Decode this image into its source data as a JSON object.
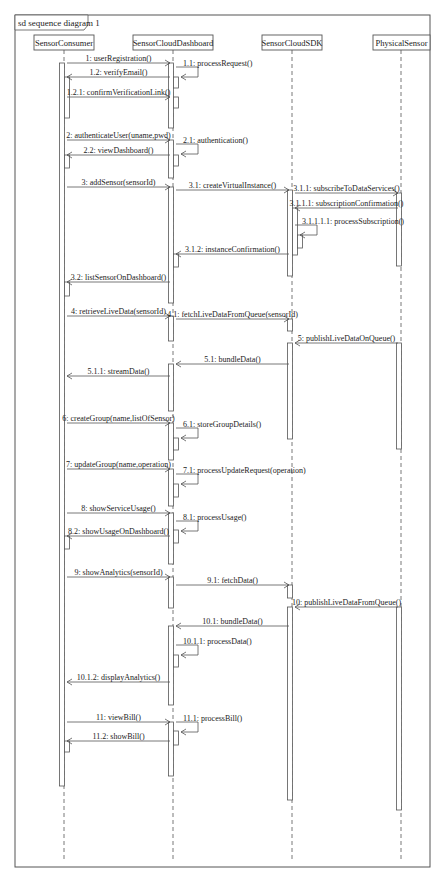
{
  "frame": {
    "title": "sd sequence diagram 1"
  },
  "lifelines": [
    {
      "name": "SensorConsumer",
      "x": 64,
      "box_x": 34,
      "box_w": 60
    },
    {
      "name": "SensorCloudDashboard",
      "x": 173,
      "box_x": 133,
      "box_w": 80
    },
    {
      "name": "SensorCloudSDK",
      "x": 292,
      "box_x": 262,
      "box_w": 60
    },
    {
      "name": "PhysicalSensor",
      "x": 401,
      "box_x": 373,
      "box_w": 57
    }
  ],
  "messages": [
    {
      "id": "m1",
      "label": "1: userRegistration()",
      "from": 0,
      "to": 1,
      "y": 63,
      "type": "call"
    },
    {
      "id": "m1_1",
      "label": "1.1: processRequest()",
      "from": 1,
      "to": 1,
      "y": 67,
      "type": "self"
    },
    {
      "id": "m1_2",
      "label": "1.2: verifyEmail()",
      "from": 1,
      "to": 0,
      "y": 77,
      "type": "return"
    },
    {
      "id": "m1_2_1",
      "label": "1.2.1: confirmVerificationLink()",
      "from": 0,
      "to": 1,
      "y": 97,
      "type": "call"
    },
    {
      "id": "m2",
      "label": "2: authenticateUser(uname,pwd)",
      "from": 0,
      "to": 1,
      "y": 140,
      "type": "call"
    },
    {
      "id": "m2_1",
      "label": "2.1: authentication()",
      "from": 1,
      "to": 1,
      "y": 144,
      "type": "self"
    },
    {
      "id": "m2_2",
      "label": "2.2: viewDashboard()",
      "from": 1,
      "to": 0,
      "y": 155,
      "type": "return"
    },
    {
      "id": "m3",
      "label": "3: addSensor(sensorId)",
      "from": 0,
      "to": 1,
      "y": 187,
      "type": "call"
    },
    {
      "id": "m3_1",
      "label": "3.1: createVirtualInstance()",
      "from": 1,
      "to": 2,
      "y": 190,
      "type": "call"
    },
    {
      "id": "m3_1_1",
      "label": "3.1.1: subscribeToDataServices()",
      "from": 2,
      "to": 3,
      "y": 193,
      "type": "call"
    },
    {
      "id": "m3_1_1_1",
      "label": "3.1.1.1: subscriptionConfirmation()",
      "from": 3,
      "to": 2,
      "y": 208,
      "type": "return"
    },
    {
      "id": "m3_1_1_1_1",
      "label": "3.1.1.1.1: processSubscription()",
      "from": 2,
      "to": 2,
      "y": 225,
      "type": "self"
    },
    {
      "id": "m3_1_2",
      "label": "3.1.2: instanceConfirmation()",
      "from": 2,
      "to": 1,
      "y": 254,
      "type": "return"
    },
    {
      "id": "m3_2",
      "label": "3.2: listSensorOnDashboard()",
      "from": 1,
      "to": 0,
      "y": 282,
      "type": "return"
    },
    {
      "id": "m4",
      "label": "4: retrieveLiveData(sensorId)",
      "from": 0,
      "to": 1,
      "y": 316,
      "type": "call"
    },
    {
      "id": "m4_1",
      "label": "4.1: fetchLiveDataFromQueue(sensorId)",
      "from": 1,
      "to": 2,
      "y": 319,
      "type": "call"
    },
    {
      "id": "m5",
      "label": "5: publishLiveDataOnQueue()",
      "from": 3,
      "to": 2,
      "y": 343,
      "type": "return"
    },
    {
      "id": "m5_1",
      "label": "5.1: bundleData()",
      "from": 2,
      "to": 1,
      "y": 364,
      "type": "return"
    },
    {
      "id": "m5_1_1",
      "label": "5.1.1: streamData()",
      "from": 1,
      "to": 0,
      "y": 376,
      "type": "return"
    },
    {
      "id": "m6",
      "label": "6: createGroup(name,listOfSensor)",
      "from": 0,
      "to": 1,
      "y": 423,
      "type": "call"
    },
    {
      "id": "m6_1",
      "label": "6.1: storeGroupDetails()",
      "from": 1,
      "to": 1,
      "y": 428,
      "type": "self"
    },
    {
      "id": "m7",
      "label": "7: updateGroup(name,operation)",
      "from": 0,
      "to": 1,
      "y": 469,
      "type": "call"
    },
    {
      "id": "m7_1",
      "label": "7.1: processUpdateRequest(operation)",
      "from": 1,
      "to": 1,
      "y": 474,
      "type": "self"
    },
    {
      "id": "m8",
      "label": "8: showServiceUsage()",
      "from": 0,
      "to": 1,
      "y": 513,
      "type": "call"
    },
    {
      "id": "m8_1",
      "label": "8.1: processUsage()",
      "from": 1,
      "to": 1,
      "y": 521,
      "type": "self"
    },
    {
      "id": "m8_2",
      "label": "8.2: showUsageOnDashboard()",
      "from": 1,
      "to": 0,
      "y": 536,
      "type": "return"
    },
    {
      "id": "m9",
      "label": "9: showAnalytics(sensorId)",
      "from": 0,
      "to": 1,
      "y": 577,
      "type": "call"
    },
    {
      "id": "m9_1",
      "label": "9.1: fetchData()",
      "from": 1,
      "to": 2,
      "y": 585,
      "type": "call"
    },
    {
      "id": "m10",
      "label": "10: publishLiveDataFromQueue()",
      "from": 3,
      "to": 2,
      "y": 607,
      "type": "return"
    },
    {
      "id": "m10_1",
      "label": "10.1: bundleData()",
      "from": 2,
      "to": 1,
      "y": 626,
      "type": "return"
    },
    {
      "id": "m10_1_1",
      "label": "10.1.1: processData()",
      "from": 1,
      "to": 1,
      "y": 645,
      "type": "self"
    },
    {
      "id": "m10_1_2",
      "label": "10.1.2: displayAnalytics()",
      "from": 1,
      "to": 0,
      "y": 682,
      "type": "return"
    },
    {
      "id": "m11",
      "label": "11: viewBill()",
      "from": 0,
      "to": 1,
      "y": 722,
      "type": "call"
    },
    {
      "id": "m11_1",
      "label": "11.1: processBill()",
      "from": 1,
      "to": 1,
      "y": 722,
      "type": "self"
    },
    {
      "id": "m11_2",
      "label": "11.2: showBill()",
      "from": 1,
      "to": 0,
      "y": 741,
      "type": "return"
    }
  ],
  "activations": [
    {
      "lifeline": 0,
      "y1": 63,
      "y2": 786,
      "dx": -2
    },
    {
      "lifeline": 0,
      "y1": 77,
      "y2": 118,
      "dx": 3
    },
    {
      "lifeline": 0,
      "y1": 155,
      "y2": 168,
      "dx": 3
    },
    {
      "lifeline": 0,
      "y1": 282,
      "y2": 296,
      "dx": 3
    },
    {
      "lifeline": 0,
      "y1": 536,
      "y2": 549,
      "dx": 3
    },
    {
      "lifeline": 0,
      "y1": 741,
      "y2": 752,
      "dx": 3
    },
    {
      "lifeline": 1,
      "y1": 63,
      "y2": 128,
      "dx": -2
    },
    {
      "lifeline": 1,
      "y1": 77,
      "y2": 88,
      "dx": 3
    },
    {
      "lifeline": 1,
      "y1": 97,
      "y2": 108,
      "dx": 3
    },
    {
      "lifeline": 1,
      "y1": 140,
      "y2": 178,
      "dx": -2
    },
    {
      "lifeline": 1,
      "y1": 155,
      "y2": 166,
      "dx": 3
    },
    {
      "lifeline": 1,
      "y1": 187,
      "y2": 303,
      "dx": -2
    },
    {
      "lifeline": 1,
      "y1": 254,
      "y2": 267,
      "dx": 3
    },
    {
      "lifeline": 1,
      "y1": 316,
      "y2": 341,
      "dx": -2
    },
    {
      "lifeline": 1,
      "y1": 364,
      "y2": 411,
      "dx": -2
    },
    {
      "lifeline": 1,
      "y1": 423,
      "y2": 460,
      "dx": -2
    },
    {
      "lifeline": 1,
      "y1": 438,
      "y2": 450,
      "dx": 3
    },
    {
      "lifeline": 1,
      "y1": 469,
      "y2": 506,
      "dx": -2
    },
    {
      "lifeline": 1,
      "y1": 484,
      "y2": 497,
      "dx": 3
    },
    {
      "lifeline": 1,
      "y1": 513,
      "y2": 564,
      "dx": -2
    },
    {
      "lifeline": 1,
      "y1": 530,
      "y2": 543,
      "dx": 3
    },
    {
      "lifeline": 1,
      "y1": 577,
      "y2": 608,
      "dx": -2
    },
    {
      "lifeline": 1,
      "y1": 626,
      "y2": 705,
      "dx": -2
    },
    {
      "lifeline": 1,
      "y1": 655,
      "y2": 667,
      "dx": 3
    },
    {
      "lifeline": 1,
      "y1": 722,
      "y2": 776,
      "dx": -2
    },
    {
      "lifeline": 1,
      "y1": 731,
      "y2": 745,
      "dx": 3
    },
    {
      "lifeline": 2,
      "y1": 190,
      "y2": 276,
      "dx": -2
    },
    {
      "lifeline": 2,
      "y1": 208,
      "y2": 255,
      "dx": 3
    },
    {
      "lifeline": 2,
      "y1": 235,
      "y2": 248,
      "dx": 8
    },
    {
      "lifeline": 2,
      "y1": 319,
      "y2": 331,
      "dx": -2
    },
    {
      "lifeline": 2,
      "y1": 343,
      "y2": 439,
      "dx": -2
    },
    {
      "lifeline": 2,
      "y1": 585,
      "y2": 598,
      "dx": -2
    },
    {
      "lifeline": 2,
      "y1": 607,
      "y2": 800,
      "dx": -2
    },
    {
      "lifeline": 3,
      "y1": 193,
      "y2": 266,
      "dx": -2
    },
    {
      "lifeline": 3,
      "y1": 343,
      "y2": 449,
      "dx": -2
    },
    {
      "lifeline": 3,
      "y1": 607,
      "y2": 810,
      "dx": -2
    }
  ],
  "colors": {
    "line": "#555555",
    "text": "#222222",
    "background": "#ffffff"
  }
}
